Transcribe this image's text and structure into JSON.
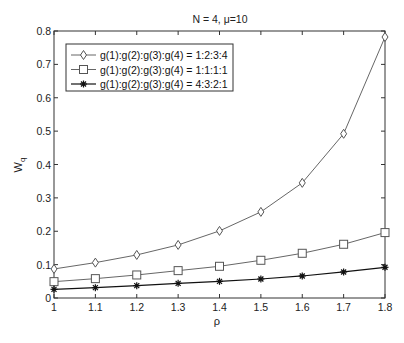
{
  "chart_data": {
    "type": "line",
    "title": "N = 4, μ=10",
    "xlabel": "ρ",
    "ylabel": "W",
    "ylabel_subscript": "q",
    "x": [
      1.0,
      1.1,
      1.2,
      1.3,
      1.4,
      1.5,
      1.6,
      1.7,
      1.8
    ],
    "xlim": [
      1,
      1.8
    ],
    "ylim": [
      0,
      0.8
    ],
    "xticks": [
      "1",
      "1.1",
      "1.2",
      "1.3",
      "1.4",
      "1.5",
      "1.6",
      "1.7",
      "1.8"
    ],
    "yticks": [
      "0",
      "0.1",
      "0.2",
      "0.3",
      "0.4",
      "0.5",
      "0.6",
      "0.7",
      "0.8"
    ],
    "grid": false,
    "legend_position": "upper left",
    "series": [
      {
        "name": "g(1):g(2):g(3):g(4) = 1:2:3:4",
        "marker": "diamond",
        "color": "#555555",
        "values": [
          0.087,
          0.106,
          0.129,
          0.159,
          0.201,
          0.258,
          0.345,
          0.492,
          0.782
        ]
      },
      {
        "name": "g(1):g(2):g(3):g(4) = 1:1:1:1",
        "marker": "square",
        "color": "#555555",
        "values": [
          0.049,
          0.058,
          0.069,
          0.082,
          0.095,
          0.113,
          0.134,
          0.161,
          0.196
        ]
      },
      {
        "name": "g(1):g(2):g(3):g(4) = 4:3:2:1",
        "marker": "star",
        "color": "#111111",
        "values": [
          0.026,
          0.031,
          0.037,
          0.044,
          0.05,
          0.057,
          0.066,
          0.078,
          0.092
        ]
      }
    ]
  }
}
